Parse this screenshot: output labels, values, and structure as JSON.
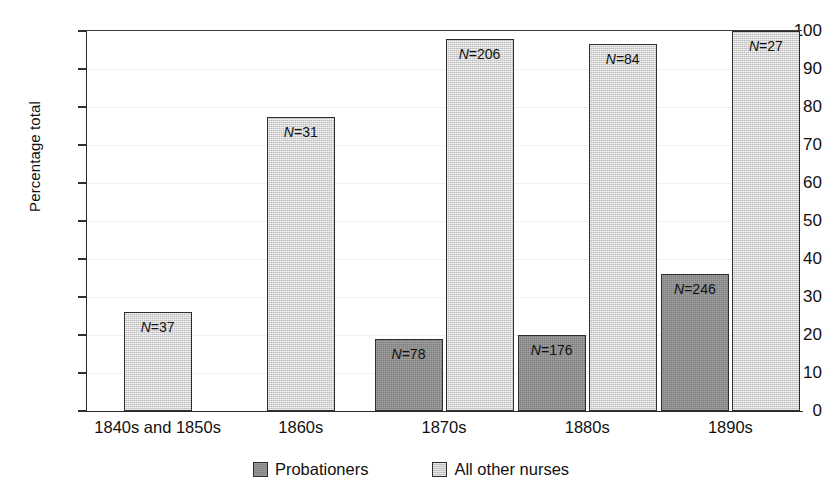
{
  "chart_data": {
    "type": "bar",
    "title": "",
    "xlabel": "",
    "ylabel": "Percentage total",
    "ylim": [
      0,
      100
    ],
    "yticks": [
      0,
      10,
      20,
      30,
      40,
      50,
      60,
      70,
      80,
      90,
      100
    ],
    "ytick_labels": [
      "0",
      "10",
      "20",
      "30",
      "40",
      "50",
      "60",
      "70",
      "80",
      "90",
      "100"
    ],
    "grid": true,
    "legend_position": "bottom-center",
    "categories": [
      "1840s and 1850s",
      "1860s",
      "1870s",
      "1880s",
      "1890s"
    ],
    "series": [
      {
        "name": "Probationers",
        "color": "#8d8d8d",
        "values": [
          null,
          null,
          19,
          20,
          36
        ],
        "point_labels": [
          "",
          "",
          "N=78",
          "N=176",
          "N=246"
        ],
        "counts": [
          null,
          null,
          78,
          176,
          246
        ]
      },
      {
        "name": "All other nurses",
        "color": "#cccccc",
        "values": [
          26,
          77.5,
          98,
          96.5,
          100
        ],
        "point_labels": [
          "N=37",
          "N=31",
          "N=206",
          "N=84",
          "N=27"
        ],
        "counts": [
          37,
          31,
          206,
          84,
          27
        ]
      }
    ]
  },
  "legend": {
    "items": [
      {
        "label": "Probationers",
        "swatch": "dark"
      },
      {
        "label": "All other nurses",
        "swatch": "light"
      }
    ]
  },
  "axis": {
    "y_title": "Percentage total"
  }
}
